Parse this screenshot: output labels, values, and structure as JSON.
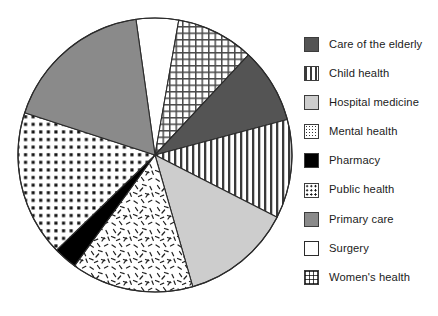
{
  "chart_data": {
    "type": "pie",
    "title": "",
    "subtitle": "",
    "xlabel": "",
    "ylabel": "",
    "grid": false,
    "legend_position": "right",
    "start_angle_deg": 352,
    "direction": "clockwise",
    "center": {
      "x": 155,
      "y": 155
    },
    "radius": 137,
    "categories": [
      "Surgery",
      "Women's health",
      "Care of the elderly",
      "Child health",
      "Hospital medicine",
      "Mental health",
      "Pharmacy",
      "Public health",
      "Primary care"
    ],
    "values": [
      5,
      9.2,
      8.9,
      11.7,
      13.1,
      14.4,
      2.8,
      17.2,
      17.7
    ],
    "value_unit": "percent",
    "slices": [
      {
        "label": "Surgery",
        "value": 5,
        "angle_deg": 18,
        "start_deg": 352,
        "end_deg": 10,
        "fill": "#ffffff",
        "pattern": "solid",
        "swatch": "solid-white"
      },
      {
        "label": "Women's health",
        "value": 9.2,
        "angle_deg": 33,
        "start_deg": 10,
        "end_deg": 43,
        "fill": "#ffffff",
        "pattern": "crosshatch-grid",
        "swatch": "crosshatch-grid"
      },
      {
        "label": "Care of the elderly",
        "value": 8.9,
        "angle_deg": 32,
        "start_deg": 43,
        "end_deg": 75,
        "fill": "#545454",
        "pattern": "solid",
        "swatch": "solid-dark-gray"
      },
      {
        "label": "Child health",
        "value": 11.7,
        "angle_deg": 42,
        "start_deg": 75,
        "end_deg": 117,
        "fill": "#ffffff",
        "pattern": "vertical-stripes",
        "swatch": "vertical-stripes"
      },
      {
        "label": "Hospital medicine",
        "value": 13.1,
        "angle_deg": 47,
        "start_deg": 117,
        "end_deg": 164,
        "fill": "#cdcdcd",
        "pattern": "solid",
        "swatch": "solid-light-gray"
      },
      {
        "label": "Mental health",
        "value": 14.4,
        "angle_deg": 52,
        "start_deg": 164,
        "end_deg": 216,
        "fill": "#ffffff",
        "pattern": "speckle-squiggle",
        "swatch": "speckle-squiggle"
      },
      {
        "label": "Pharmacy",
        "value": 2.8,
        "angle_deg": 10,
        "start_deg": 216,
        "end_deg": 226,
        "fill": "#000000",
        "pattern": "solid",
        "swatch": "solid-black"
      },
      {
        "label": "Public health",
        "value": 17.2,
        "angle_deg": 62,
        "start_deg": 226,
        "end_deg": 288,
        "fill": "#ffffff",
        "pattern": "dot-grid",
        "swatch": "dot-grid"
      },
      {
        "label": "Primary care",
        "value": 17.7,
        "angle_deg": 64,
        "start_deg": 288,
        "end_deg": 352,
        "fill": "#8a8a8a",
        "pattern": "solid",
        "swatch": "solid-medium-gray"
      }
    ],
    "outline_color": "#2b2b2b"
  },
  "legend": {
    "items": [
      {
        "label": "Care of the elderly",
        "swatch": "solid-dark-gray"
      },
      {
        "label": "Child health",
        "swatch": "vertical-stripes"
      },
      {
        "label": "Hospital medicine",
        "swatch": "solid-light-gray"
      },
      {
        "label": "Mental health",
        "swatch": "speckle-squiggle"
      },
      {
        "label": "Pharmacy",
        "swatch": "solid-black"
      },
      {
        "label": "Public health",
        "swatch": "dot-grid"
      },
      {
        "label": "Primary care",
        "swatch": "solid-medium-gray"
      },
      {
        "label": "Surgery",
        "swatch": "solid-white"
      },
      {
        "label": "Women's health",
        "swatch": "crosshatch-grid"
      }
    ]
  },
  "colors": {
    "dark_gray": "#545454",
    "medium_gray": "#8a8a8a",
    "light_gray": "#cdcdcd",
    "black": "#000000",
    "white": "#ffffff",
    "outline": "#2b2b2b",
    "text": "#1b1b1b"
  }
}
